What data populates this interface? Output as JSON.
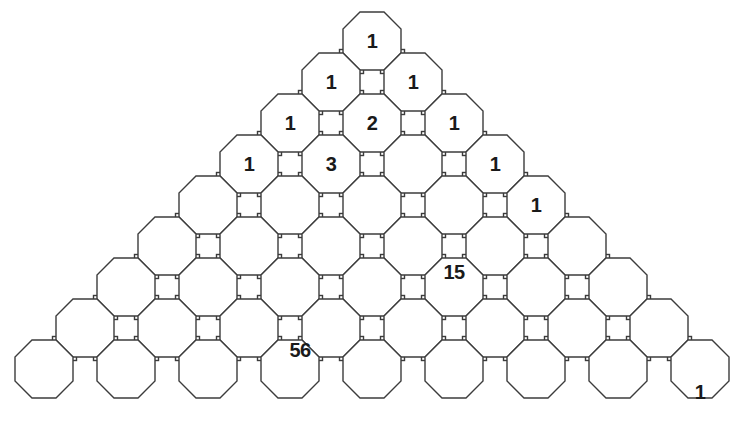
{
  "figure": {
    "name": "pascals-triangle-octagon-tessellation",
    "background_color": "#ffffff",
    "stroke_color": "#3c3c3c",
    "stroke_width": 1.4,
    "text_color": "#1a1a1a",
    "octagon_width": 58,
    "square_size": 24,
    "pitch_x": 82,
    "pitch_y": 41,
    "rows": 9
  },
  "chart_data": {
    "type": "table",
    "xlabel": "",
    "ylabel": "",
    "rows": [
      {
        "row": 1,
        "count": 1,
        "values": [
          "1"
        ]
      },
      {
        "row": 2,
        "count": 2,
        "values": [
          "1",
          "1"
        ]
      },
      {
        "row": 3,
        "count": 3,
        "values": [
          "1",
          "2",
          "1"
        ]
      },
      {
        "row": 4,
        "count": 4,
        "values": [
          "1",
          "3",
          "",
          "1"
        ]
      },
      {
        "row": 5,
        "count": 5,
        "values": [
          "",
          "",
          "",
          "",
          "1"
        ]
      },
      {
        "row": 6,
        "count": 6,
        "values": [
          "",
          "",
          "",
          "",
          "",
          ""
        ]
      },
      {
        "row": 7,
        "count": 7,
        "values": [
          "",
          "",
          "",
          "",
          "",
          "15",
          ""
        ]
      },
      {
        "row": 8,
        "count": 8,
        "values": [
          "",
          "",
          "",
          "56",
          "",
          "",
          "",
          ""
        ]
      },
      {
        "row": 9,
        "count": 9,
        "values": [
          "",
          "",
          "",
          "",
          "",
          "",
          "",
          "",
          "1"
        ]
      }
    ],
    "labels": [
      {
        "text": "1",
        "row": 1,
        "col": 1,
        "x": 372,
        "y": 41
      },
      {
        "text": "1",
        "row": 2,
        "col": 1,
        "x": 331,
        "y": 82
      },
      {
        "text": "1",
        "row": 2,
        "col": 2,
        "x": 413,
        "y": 82
      },
      {
        "text": "1",
        "row": 3,
        "col": 1,
        "x": 290,
        "y": 123
      },
      {
        "text": "2",
        "row": 3,
        "col": 2,
        "x": 372,
        "y": 123
      },
      {
        "text": "1",
        "row": 3,
        "col": 3,
        "x": 454,
        "y": 123
      },
      {
        "text": "1",
        "row": 4,
        "col": 1,
        "x": 249,
        "y": 164
      },
      {
        "text": "3",
        "row": 4,
        "col": 2,
        "x": 331,
        "y": 164
      },
      {
        "text": "1",
        "row": 4,
        "col": 4,
        "x": 495,
        "y": 164
      },
      {
        "text": "1",
        "row": 5,
        "col": 5,
        "x": 536,
        "y": 205
      },
      {
        "text": "15",
        "row": 7,
        "col": 6,
        "x": 454,
        "y": 272
      },
      {
        "text": "56",
        "row": 8,
        "col": 4,
        "x": 300,
        "y": 350
      },
      {
        "text": "1",
        "row": 9,
        "col": 9,
        "x": 700,
        "y": 392
      }
    ]
  }
}
